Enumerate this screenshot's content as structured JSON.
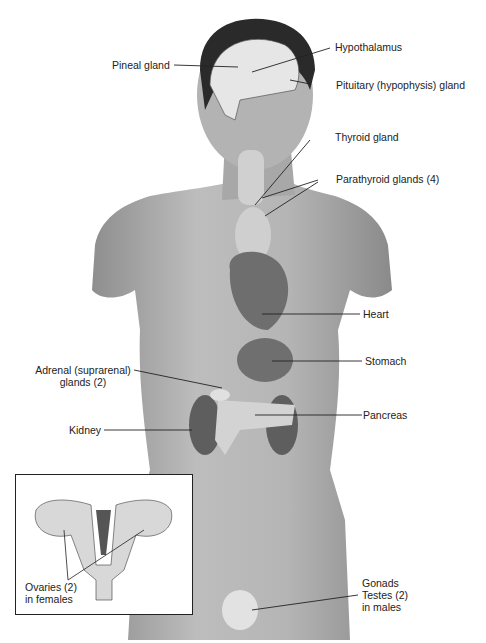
{
  "figure": {
    "colors": {
      "skin": "#9a9a9a",
      "skin_light": "#c4c4c4",
      "hair": "#2a2a2a",
      "organ_dark": "#6a6a6a",
      "organ_light": "#dcdcdc",
      "line": "#222222"
    }
  },
  "labels": {
    "pineal": "Pineal gland",
    "hypothalamus": "Hypothalamus",
    "pituitary": "Pituitary (hypophysis) gland",
    "thyroid": "Thyroid gland",
    "parathyroid": "Parathyroid glands (4)",
    "heart": "Heart",
    "stomach": "Stomach",
    "adrenal_1": "Adrenal (suprarenal)",
    "adrenal_2": "glands (2)",
    "pancreas": "Pancreas",
    "kidney": "Kidney",
    "ovaries_1": "Ovaries (2)",
    "ovaries_2": "in females",
    "gonads": "Gonads",
    "testes_1": "Testes (2)",
    "testes_2": "in males"
  }
}
